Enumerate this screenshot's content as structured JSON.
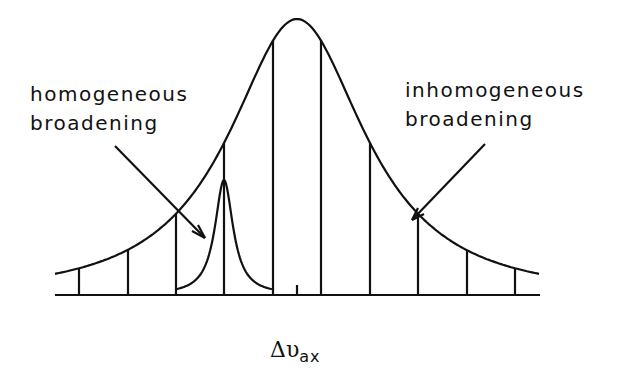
{
  "diagram": {
    "labels": {
      "homogeneous": "homogeneous\nbroadening",
      "inhomogeneous": "inhomogeneous\nbroadening"
    },
    "axis_label": {
      "symbol": "Δυ",
      "subscript": "ax"
    },
    "colors": {
      "line": "#111111",
      "background": "#ffffff"
    },
    "envelope": {
      "type": "gaussian-like",
      "peak_x": 297,
      "peak_y": 21,
      "baseline_y": 295
    },
    "homogeneous_line": {
      "center_x": 224,
      "peak_y": 180
    },
    "mode_lines_x": [
      79,
      128,
      176,
      224,
      273,
      321,
      370,
      418,
      467,
      515
    ],
    "center_tick_x": 297
  }
}
